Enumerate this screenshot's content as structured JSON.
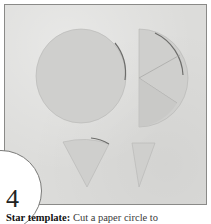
{
  "figure": {
    "step_number": "4",
    "caption_bold": "Star template:",
    "caption_text": " Cut a paper circle to",
    "photo_description": "Paper circle, circle cut in half and divided into three wedges, and two cut wedge shapes on a light grey background",
    "colors": {
      "background": "#dcdcda",
      "paper": "#cfcfcd",
      "border": "#8a8a88",
      "text": "#222222"
    }
  }
}
